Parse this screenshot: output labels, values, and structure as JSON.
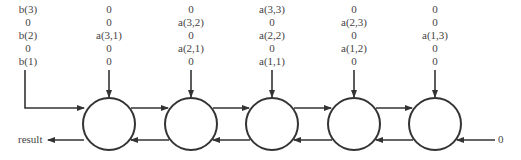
{
  "diagram": {
    "type": "systolic-array",
    "input_columns": [
      {
        "id": "b",
        "x": 28,
        "values": [
          "b(3)",
          "0",
          "b(2)",
          "0",
          "b(1)"
        ]
      },
      {
        "id": "c1",
        "x": 109,
        "values": [
          "0",
          "0",
          "a(3,1)",
          "0",
          "0"
        ]
      },
      {
        "id": "c2",
        "x": 191,
        "values": [
          "0",
          "a(3,2)",
          "0",
          "a(2,1)",
          "0"
        ]
      },
      {
        "id": "c3",
        "x": 272,
        "values": [
          "a(3,3)",
          "0",
          "a(2,2)",
          "0",
          "a(1,1)"
        ]
      },
      {
        "id": "c4",
        "x": 354,
        "values": [
          "0",
          "a(2,3)",
          "0",
          "a(1,2)",
          "0"
        ]
      },
      {
        "id": "c5",
        "x": 435,
        "values": [
          "0",
          "0",
          "a(1,3)",
          "0",
          "0"
        ]
      }
    ],
    "cells": [
      {
        "id": "cell-1",
        "cx": 109
      },
      {
        "id": "cell-2",
        "cx": 191
      },
      {
        "id": "cell-3",
        "cx": 272
      },
      {
        "id": "cell-4",
        "cx": 354
      },
      {
        "id": "cell-5",
        "cx": 435
      }
    ],
    "output_label": "result",
    "right_input_label": "0",
    "colors": {
      "stroke": "#333333",
      "text": "#444444",
      "background": "#ffffff"
    }
  }
}
